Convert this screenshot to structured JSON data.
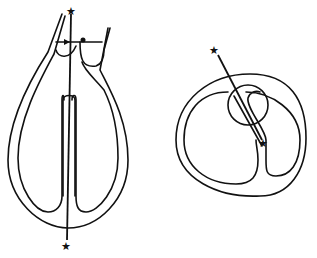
{
  "diagram": {
    "type": "line-drawing",
    "colors": {
      "stroke": "#111111",
      "background": "#ffffff"
    },
    "figures": [
      {
        "name": "longitudinal-section",
        "markers": [
          {
            "symbol": "★",
            "position": "top"
          },
          {
            "symbol": "★",
            "position": "bottom"
          }
        ],
        "line": "vertical cutting line through septum"
      },
      {
        "name": "cross-section",
        "markers": [
          {
            "symbol": "★",
            "position": "outside-top"
          },
          {
            "symbol": "★",
            "position": "inside-septum"
          }
        ],
        "line": "diagonal cutting line through circle"
      }
    ]
  }
}
